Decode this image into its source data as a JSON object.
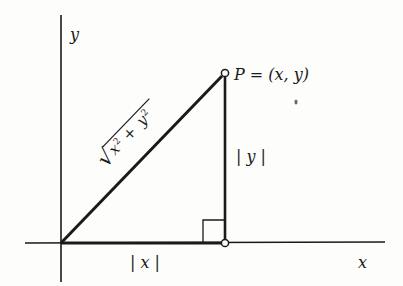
{
  "diagram": {
    "type": "right-triangle-distance",
    "axes": {
      "x_label": "x",
      "y_label": "y"
    },
    "point": {
      "label": "P = (x, y)",
      "name": "P",
      "coords": "(x, y)"
    },
    "hypotenuse_label": {
      "radical": "√",
      "term1": "x",
      "exp1": "2",
      "plus": "+",
      "term2": "y",
      "exp2": "2"
    },
    "vertical_leg_label": "| y |",
    "horizontal_leg_label": "| x |",
    "colors": {
      "stroke": "#1a1a1a",
      "background": "#fdfdfb"
    }
  }
}
